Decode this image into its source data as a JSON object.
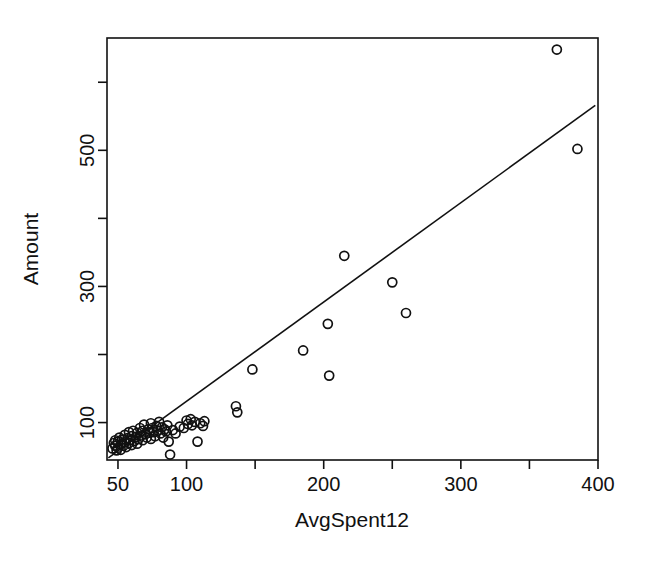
{
  "chart_data": {
    "type": "scatter",
    "title": "",
    "xlabel": "AvgSpent12",
    "ylabel": "Amount",
    "xlim": [
      42,
      400
    ],
    "ylim": [
      45,
      665
    ],
    "grid": false,
    "legend": null,
    "x_ticks": [
      50,
      100,
      150,
      200,
      250,
      300,
      350,
      400
    ],
    "x_tick_labels": [
      "50",
      "100",
      "",
      "200",
      "",
      "300",
      "",
      "400"
    ],
    "y_ticks": [
      100,
      200,
      300,
      400,
      500,
      600
    ],
    "y_tick_labels": [
      "100",
      "",
      "300",
      "",
      "500",
      ""
    ],
    "marker": "open-circle",
    "marker_size": 9,
    "marker_color": "#111111",
    "line_color": "#111111",
    "fit_line": {
      "label": "regression-line",
      "x1": 43,
      "y1": 48,
      "x2": 398,
      "y2": 566
    },
    "points": [
      {
        "x": 46,
        "y": 62
      },
      {
        "x": 47,
        "y": 70
      },
      {
        "x": 48,
        "y": 66
      },
      {
        "x": 48,
        "y": 74
      },
      {
        "x": 49,
        "y": 59
      },
      {
        "x": 50,
        "y": 72
      },
      {
        "x": 50,
        "y": 63
      },
      {
        "x": 51,
        "y": 78
      },
      {
        "x": 52,
        "y": 68
      },
      {
        "x": 52,
        "y": 60
      },
      {
        "x": 53,
        "y": 75
      },
      {
        "x": 54,
        "y": 66
      },
      {
        "x": 55,
        "y": 82
      },
      {
        "x": 55,
        "y": 71
      },
      {
        "x": 56,
        "y": 64
      },
      {
        "x": 57,
        "y": 77
      },
      {
        "x": 58,
        "y": 70
      },
      {
        "x": 58,
        "y": 86
      },
      {
        "x": 59,
        "y": 74
      },
      {
        "x": 60,
        "y": 67
      },
      {
        "x": 60,
        "y": 80
      },
      {
        "x": 61,
        "y": 88
      },
      {
        "x": 62,
        "y": 73
      },
      {
        "x": 63,
        "y": 79
      },
      {
        "x": 64,
        "y": 69
      },
      {
        "x": 64,
        "y": 85
      },
      {
        "x": 65,
        "y": 76
      },
      {
        "x": 66,
        "y": 92
      },
      {
        "x": 67,
        "y": 81
      },
      {
        "x": 68,
        "y": 74
      },
      {
        "x": 68,
        "y": 88
      },
      {
        "x": 69,
        "y": 97
      },
      {
        "x": 70,
        "y": 83
      },
      {
        "x": 71,
        "y": 78
      },
      {
        "x": 72,
        "y": 90
      },
      {
        "x": 73,
        "y": 85
      },
      {
        "x": 74,
        "y": 99
      },
      {
        "x": 74,
        "y": 76
      },
      {
        "x": 75,
        "y": 92
      },
      {
        "x": 76,
        "y": 86
      },
      {
        "x": 77,
        "y": 80
      },
      {
        "x": 78,
        "y": 95
      },
      {
        "x": 79,
        "y": 88
      },
      {
        "x": 80,
        "y": 101
      },
      {
        "x": 81,
        "y": 84
      },
      {
        "x": 82,
        "y": 93
      },
      {
        "x": 83,
        "y": 78
      },
      {
        "x": 84,
        "y": 90
      },
      {
        "x": 85,
        "y": 87
      },
      {
        "x": 86,
        "y": 96
      },
      {
        "x": 87,
        "y": 72
      },
      {
        "x": 88,
        "y": 53
      },
      {
        "x": 90,
        "y": 89
      },
      {
        "x": 92,
        "y": 84
      },
      {
        "x": 95,
        "y": 94
      },
      {
        "x": 98,
        "y": 92
      },
      {
        "x": 100,
        "y": 103
      },
      {
        "x": 101,
        "y": 98
      },
      {
        "x": 103,
        "y": 105
      },
      {
        "x": 104,
        "y": 96
      },
      {
        "x": 106,
        "y": 101
      },
      {
        "x": 108,
        "y": 72
      },
      {
        "x": 110,
        "y": 99
      },
      {
        "x": 112,
        "y": 95
      },
      {
        "x": 113,
        "y": 102
      },
      {
        "x": 136,
        "y": 124
      },
      {
        "x": 137,
        "y": 115
      },
      {
        "x": 148,
        "y": 178
      },
      {
        "x": 185,
        "y": 206
      },
      {
        "x": 203,
        "y": 245
      },
      {
        "x": 204,
        "y": 169
      },
      {
        "x": 215,
        "y": 345
      },
      {
        "x": 250,
        "y": 306
      },
      {
        "x": 260,
        "y": 261
      },
      {
        "x": 370,
        "y": 648
      },
      {
        "x": 385,
        "y": 502
      }
    ]
  },
  "axes": {
    "x_axis_name": "x-axis",
    "y_axis_name": "y-axis"
  }
}
